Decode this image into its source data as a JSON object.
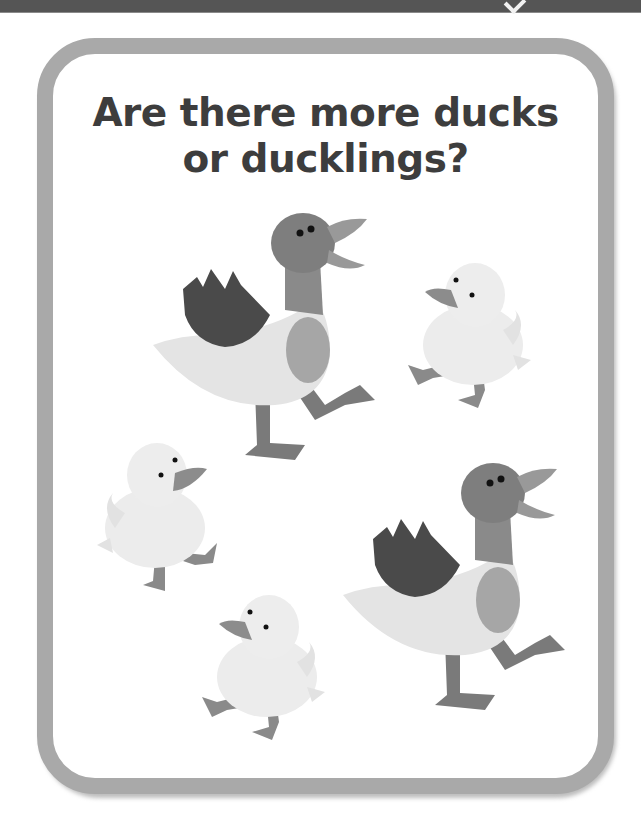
{
  "top_bar": {
    "icon": "checkmark-icon",
    "background": "#555555"
  },
  "card": {
    "border_color": "#a9a9a9",
    "title": {
      "line1": "Are there more ducks",
      "line2": "or ducklings?"
    }
  },
  "illustration": {
    "ducks": [
      {
        "name": "duck-1",
        "kind": "duck",
        "facing": "right"
      },
      {
        "name": "duck-2",
        "kind": "duck",
        "facing": "right"
      }
    ],
    "ducklings": [
      {
        "name": "duckling-1",
        "kind": "duckling",
        "facing": "left"
      },
      {
        "name": "duckling-2",
        "kind": "duckling",
        "facing": "right"
      },
      {
        "name": "duckling-3",
        "kind": "duckling",
        "facing": "left"
      }
    ],
    "counts": {
      "ducks": 2,
      "ducklings": 3
    },
    "colors": {
      "duck_head": "#7e7e7e",
      "duck_wing": "#4a4a4a",
      "duck_body": "#e4e4e4",
      "duck_chest": "#a6a6a6",
      "duck_legs": "#7a7a7a",
      "duckling_body": "#ececec",
      "duckling_beak": "#8c8c8c"
    }
  }
}
